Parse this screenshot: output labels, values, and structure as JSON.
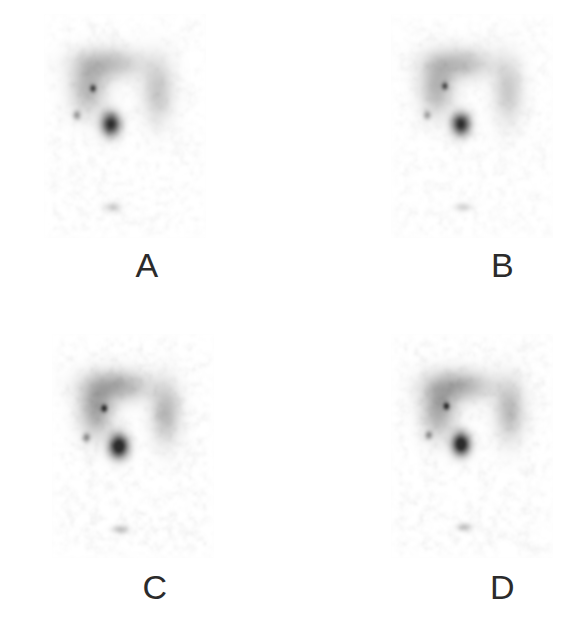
{
  "figure": {
    "type": "nuclear-medicine-scintigraphy-panel-figure",
    "background_color": "#ffffff",
    "width": 579,
    "height": 640,
    "columns": 2,
    "rows": 2,
    "modality": "planar scintigraphy (grayscale, inverted: high uptake = dark)"
  },
  "colormap": {
    "background": "#ffffff",
    "field_base": "#fcfcfc",
    "noise_dark": "#e8e8e8",
    "diffuse_uptake": "#b9b9b9",
    "moderate_uptake": "#9a9a9a",
    "focal_hotspot": "#4a4a4a",
    "small_dot": "#6f6f6f",
    "faint_spot": "#cfcfcf",
    "label_color": "#2b2b2b"
  },
  "panels": [
    {
      "id": "panel-a",
      "label": "A",
      "field": {
        "x": 44,
        "y": 14,
        "width": 162,
        "height": 224
      },
      "features": {
        "diffuse_band": {
          "cx": 0.4,
          "cy": 0.22,
          "rx": 0.3,
          "ry": 0.1,
          "intensity": 0.3
        },
        "left_lobe": {
          "cx": 0.27,
          "cy": 0.33,
          "rx": 0.16,
          "ry": 0.17,
          "intensity": 0.33
        },
        "right_lobe": {
          "cx": 0.7,
          "cy": 0.34,
          "rx": 0.14,
          "ry": 0.2,
          "intensity": 0.26
        },
        "focal_hotspot": {
          "cx": 0.41,
          "cy": 0.49,
          "rx": 0.085,
          "ry": 0.075,
          "intensity": 1.0
        },
        "upper_dot": {
          "cx": 0.3,
          "cy": 0.33,
          "rx": 0.028,
          "ry": 0.024,
          "intensity": 0.62
        },
        "small_left_dot": {
          "cx": 0.2,
          "cy": 0.45,
          "rx": 0.035,
          "ry": 0.03,
          "intensity": 0.4
        },
        "lower_faint_spot": {
          "cx": 0.42,
          "cy": 0.86,
          "rx": 0.075,
          "ry": 0.03,
          "intensity": 0.22
        }
      },
      "noise_seed": 11,
      "noise_amount": 0.055,
      "contrast": 1.0
    },
    {
      "id": "panel-b",
      "label": "B",
      "field": {
        "x": 101,
        "y": 14,
        "width": 162,
        "height": 224
      },
      "features": {
        "diffuse_band": {
          "cx": 0.42,
          "cy": 0.22,
          "rx": 0.29,
          "ry": 0.1,
          "intensity": 0.31
        },
        "left_lobe": {
          "cx": 0.28,
          "cy": 0.33,
          "rx": 0.15,
          "ry": 0.17,
          "intensity": 0.34
        },
        "right_lobe": {
          "cx": 0.72,
          "cy": 0.34,
          "rx": 0.13,
          "ry": 0.2,
          "intensity": 0.25
        },
        "focal_hotspot": {
          "cx": 0.43,
          "cy": 0.49,
          "rx": 0.082,
          "ry": 0.072,
          "intensity": 1.0
        },
        "upper_dot": {
          "cx": 0.33,
          "cy": 0.32,
          "rx": 0.028,
          "ry": 0.024,
          "intensity": 0.6
        },
        "small_left_dot": {
          "cx": 0.22,
          "cy": 0.45,
          "rx": 0.033,
          "ry": 0.028,
          "intensity": 0.38
        },
        "lower_faint_spot": {
          "cx": 0.44,
          "cy": 0.86,
          "rx": 0.07,
          "ry": 0.028,
          "intensity": 0.2
        }
      },
      "noise_seed": 29,
      "noise_amount": 0.055,
      "contrast": 1.0
    },
    {
      "id": "panel-c",
      "label": "C",
      "field": {
        "x": 52,
        "y": 14,
        "width": 162,
        "height": 224
      },
      "features": {
        "diffuse_band": {
          "cx": 0.4,
          "cy": 0.23,
          "rx": 0.29,
          "ry": 0.1,
          "intensity": 0.35
        },
        "left_lobe": {
          "cx": 0.27,
          "cy": 0.34,
          "rx": 0.15,
          "ry": 0.17,
          "intensity": 0.37
        },
        "right_lobe": {
          "cx": 0.7,
          "cy": 0.35,
          "rx": 0.13,
          "ry": 0.19,
          "intensity": 0.3
        },
        "focal_hotspot": {
          "cx": 0.41,
          "cy": 0.5,
          "rx": 0.085,
          "ry": 0.075,
          "intensity": 1.05
        },
        "upper_dot": {
          "cx": 0.32,
          "cy": 0.33,
          "rx": 0.028,
          "ry": 0.024,
          "intensity": 0.66
        },
        "small_left_dot": {
          "cx": 0.21,
          "cy": 0.46,
          "rx": 0.033,
          "ry": 0.028,
          "intensity": 0.42
        },
        "lower_faint_spot": {
          "cx": 0.42,
          "cy": 0.87,
          "rx": 0.072,
          "ry": 0.026,
          "intensity": 0.26
        }
      },
      "noise_seed": 47,
      "noise_amount": 0.065,
      "contrast": 1.1
    },
    {
      "id": "panel-d",
      "label": "D",
      "field": {
        "x": 101,
        "y": 14,
        "width": 162,
        "height": 224
      },
      "features": {
        "diffuse_band": {
          "cx": 0.42,
          "cy": 0.23,
          "rx": 0.29,
          "ry": 0.1,
          "intensity": 0.34
        },
        "left_lobe": {
          "cx": 0.29,
          "cy": 0.34,
          "rx": 0.15,
          "ry": 0.17,
          "intensity": 0.36
        },
        "right_lobe": {
          "cx": 0.73,
          "cy": 0.34,
          "rx": 0.13,
          "ry": 0.19,
          "intensity": 0.29
        },
        "focal_hotspot": {
          "cx": 0.43,
          "cy": 0.49,
          "rx": 0.08,
          "ry": 0.072,
          "intensity": 1.05
        },
        "upper_dot": {
          "cx": 0.34,
          "cy": 0.32,
          "rx": 0.027,
          "ry": 0.023,
          "intensity": 0.66
        },
        "small_left_dot": {
          "cx": 0.23,
          "cy": 0.45,
          "rx": 0.032,
          "ry": 0.027,
          "intensity": 0.4
        },
        "lower_faint_spot": {
          "cx": 0.45,
          "cy": 0.86,
          "rx": 0.068,
          "ry": 0.026,
          "intensity": 0.24
        }
      },
      "noise_seed": 83,
      "noise_amount": 0.065,
      "contrast": 1.1
    }
  ]
}
